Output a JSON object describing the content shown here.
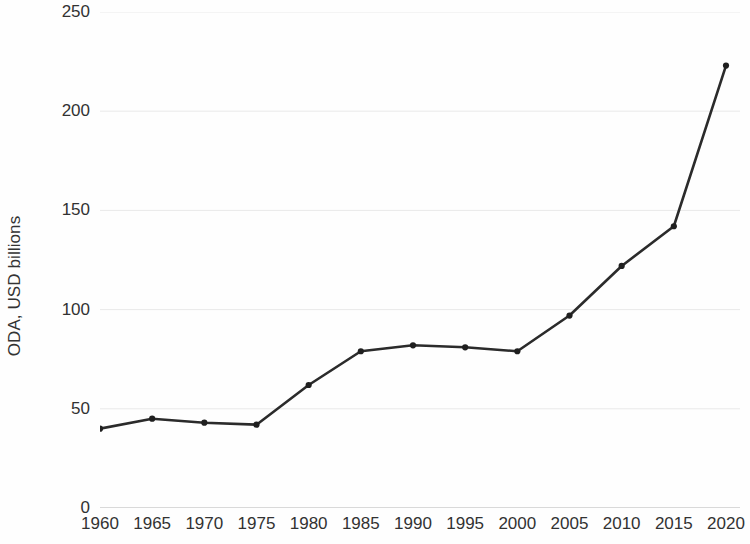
{
  "chart_data": {
    "type": "line",
    "title": "",
    "subtitle": "",
    "xlabel": "",
    "ylabel": "ODA, USD billions",
    "categories": [
      "1960",
      "1965",
      "1970",
      "1975",
      "1980",
      "1985",
      "1990",
      "1995",
      "2000",
      "2005",
      "2010",
      "2015",
      "2020"
    ],
    "x": [
      1960,
      1965,
      1970,
      1975,
      1980,
      1985,
      1990,
      1995,
      2000,
      2005,
      2010,
      2015,
      2020
    ],
    "values": [
      40,
      45,
      43,
      42,
      62,
      79,
      82,
      81,
      79,
      97,
      122,
      142,
      223
    ],
    "series": [
      {
        "name": "ODA",
        "values": [
          40,
          45,
          43,
          42,
          62,
          79,
          82,
          81,
          79,
          97,
          122,
          142,
          223
        ]
      }
    ],
    "ylim": [
      0,
      250
    ],
    "yticks": [
      0,
      50,
      100,
      150,
      200,
      250
    ],
    "ytick_labels": [
      "0",
      "50",
      "100",
      "150",
      "200",
      "250"
    ],
    "xlim": [
      1960,
      2020
    ],
    "grid": "horizontal",
    "legend": "none",
    "line_color": "#2b2b2b",
    "marker": "circle",
    "marker_color": "#1f1f1f",
    "grid_color": "#e9e9e9",
    "axis_color": "#b3b3b3",
    "background_color": "#fefefe"
  }
}
